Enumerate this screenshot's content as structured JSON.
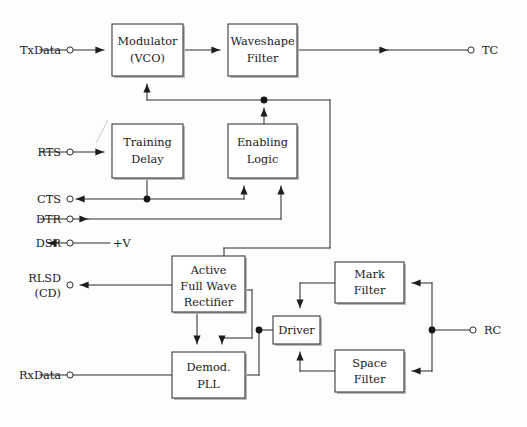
{
  "diagram": {
    "type": "block-diagram",
    "stroke_color": "#2e2e2e",
    "box_fill": "#ffffff",
    "background": "#fdfdfc",
    "blocks": [
      {
        "id": "modulator",
        "label_line1": "Modulator",
        "label_line2": "(VCO)",
        "x": 112,
        "y": 24,
        "w": 71,
        "h": 52
      },
      {
        "id": "waveshape",
        "label_line1": "Waveshape",
        "label_line2": "Filter",
        "x": 228,
        "y": 24,
        "w": 69,
        "h": 52
      },
      {
        "id": "training",
        "label_line1": "Training",
        "label_line2": "Delay",
        "x": 112,
        "y": 124,
        "w": 71,
        "h": 54
      },
      {
        "id": "enabling",
        "label_line1": "Enabling",
        "label_line2": "Logic",
        "x": 228,
        "y": 124,
        "w": 69,
        "h": 54
      },
      {
        "id": "rectifier",
        "label_line1": "Active",
        "label_line2": "Full Wave",
        "label_line3": "Rectifier",
        "x": 172,
        "y": 256,
        "w": 73,
        "h": 56
      },
      {
        "id": "markfilter",
        "label_line1": "Mark",
        "label_line2": "Filter",
        "x": 335,
        "y": 262,
        "w": 69,
        "h": 41
      },
      {
        "id": "driver",
        "label_line1": "Driver",
        "label_line2": "",
        "x": 273,
        "y": 316,
        "w": 47,
        "h": 28
      },
      {
        "id": "spacefilter",
        "label_line1": "Space",
        "label_line2": "Filter",
        "x": 335,
        "y": 350,
        "w": 69,
        "h": 42
      },
      {
        "id": "demod",
        "label_line1": "Demod.",
        "label_line2": "PLL",
        "x": 172,
        "y": 352,
        "w": 73,
        "h": 46
      }
    ],
    "pins_left": [
      {
        "id": "txdata",
        "label": "TxData",
        "y": 50,
        "direction": "in"
      },
      {
        "id": "rts",
        "label": "RTS",
        "y": 152,
        "direction": "in"
      },
      {
        "id": "cts",
        "label": "CTS",
        "y": 199,
        "direction": "out"
      },
      {
        "id": "dtr",
        "label": "DTR",
        "y": 219,
        "direction": "in"
      },
      {
        "id": "dsr",
        "label": "DSR",
        "y": 243,
        "direction": "out"
      },
      {
        "id": "rlsd",
        "label": "RLSD",
        "label2": "(CD)",
        "y": 285,
        "direction": "out"
      },
      {
        "id": "rxdata",
        "label": "RxData",
        "y": 375,
        "direction": "in"
      }
    ],
    "pins_right": [
      {
        "id": "tc",
        "label": "TC",
        "y": 50,
        "direction": "out"
      },
      {
        "id": "rc",
        "label": "RC",
        "y": 330,
        "direction": "in"
      }
    ],
    "supply": {
      "id": "vplus",
      "label": "+V",
      "x": 113,
      "y": 243
    },
    "junction_dots": [
      {
        "id": "dot-feedback-top",
        "x": 264,
        "y": 100
      },
      {
        "id": "dot-cts-branch",
        "x": 147,
        "y": 199
      },
      {
        "id": "dot-driver-input",
        "x": 259,
        "y": 330
      },
      {
        "id": "dot-rc-split",
        "x": 432,
        "y": 330
      }
    ]
  }
}
